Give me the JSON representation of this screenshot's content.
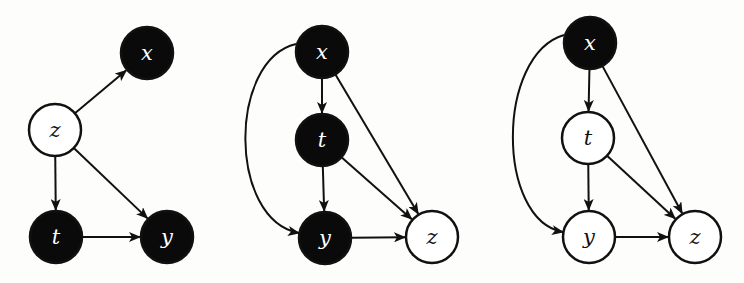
{
  "colors": {
    "background": "#fdfdfc",
    "stroke": "#111111",
    "filled_node": "#0a0a0a",
    "filled_label": "#ffffff",
    "open_node": "#ffffff",
    "open_label": "#111111"
  },
  "node_radius": 26,
  "graphs": [
    {
      "id": "graph-1",
      "nodes": [
        {
          "id": "x",
          "label": "x",
          "cx": 147,
          "cy": 53,
          "filled": true
        },
        {
          "id": "z",
          "label": "z",
          "cx": 55,
          "cy": 130,
          "filled": false
        },
        {
          "id": "t",
          "label": "t",
          "cx": 56,
          "cy": 237,
          "filled": true
        },
        {
          "id": "y",
          "label": "y",
          "cx": 167,
          "cy": 237,
          "filled": true
        }
      ],
      "edges": [
        {
          "from": "z",
          "to": "x"
        },
        {
          "from": "z",
          "to": "t"
        },
        {
          "from": "z",
          "to": "y"
        },
        {
          "from": "t",
          "to": "y"
        }
      ]
    },
    {
      "id": "graph-2",
      "nodes": [
        {
          "id": "x",
          "label": "x",
          "cx": 322,
          "cy": 52,
          "filled": true
        },
        {
          "id": "t",
          "label": "t",
          "cx": 322,
          "cy": 140,
          "filled": true
        },
        {
          "id": "y",
          "label": "y",
          "cx": 325,
          "cy": 238,
          "filled": true
        },
        {
          "id": "z",
          "label": "z",
          "cx": 432,
          "cy": 237,
          "filled": false
        }
      ],
      "edges": [
        {
          "from": "x",
          "to": "t"
        },
        {
          "from": "x",
          "to": "z"
        },
        {
          "from": "t",
          "to": "y"
        },
        {
          "from": "t",
          "to": "z"
        },
        {
          "from": "y",
          "to": "z"
        },
        {
          "from": "x",
          "to": "y",
          "curve": "M 296 44 C 228 60, 228 220, 299 233"
        }
      ]
    },
    {
      "id": "graph-3",
      "nodes": [
        {
          "id": "x",
          "label": "x",
          "cx": 590,
          "cy": 43,
          "filled": true
        },
        {
          "id": "t",
          "label": "t",
          "cx": 588,
          "cy": 138,
          "filled": false
        },
        {
          "id": "y",
          "label": "y",
          "cx": 589,
          "cy": 237,
          "filled": false
        },
        {
          "id": "z",
          "label": "z",
          "cx": 695,
          "cy": 237,
          "filled": false
        }
      ],
      "edges": [
        {
          "from": "x",
          "to": "t"
        },
        {
          "from": "x",
          "to": "z"
        },
        {
          "from": "t",
          "to": "y"
        },
        {
          "from": "t",
          "to": "z"
        },
        {
          "from": "y",
          "to": "z"
        },
        {
          "from": "x",
          "to": "y",
          "curve": "M 564 35 C 496 55, 496 220, 563 232"
        }
      ]
    }
  ]
}
